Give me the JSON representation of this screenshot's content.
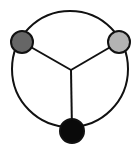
{
  "diagram": {
    "type": "graph",
    "outer_ring": {
      "cx": 70,
      "cy": 69,
      "r": 58,
      "stroke": "#111111",
      "stroke_width": 2
    },
    "junction": {
      "x": 71,
      "y": 70
    },
    "nodes": [
      {
        "id": "left",
        "cx": 22,
        "cy": 42,
        "r": 11,
        "fill": "#666666"
      },
      {
        "id": "right",
        "cx": 119,
        "cy": 42,
        "r": 11,
        "fill": "#b3b3b3"
      },
      {
        "id": "bottom",
        "cx": 72,
        "cy": 131,
        "r": 12,
        "fill": "#0a0a0a"
      }
    ],
    "edges": [
      {
        "from": "left",
        "to": "junction"
      },
      {
        "from": "right",
        "to": "junction"
      },
      {
        "from": "bottom",
        "to": "junction"
      }
    ],
    "line_color": "#111111"
  }
}
